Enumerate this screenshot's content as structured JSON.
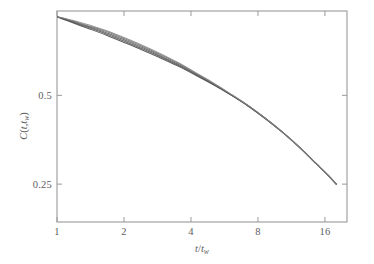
{
  "figure": {
    "background_color": "#ffffff",
    "frame_color": "#9a9a9a",
    "text_color": "#5d5d5d"
  },
  "axes": {
    "x": {
      "label_parts": {
        "numerator": "t",
        "slash": "/",
        "denominator": "t",
        "subscript": "w"
      },
      "label_plain": "t/t_w",
      "scale": "log2",
      "ticks": [
        1,
        2,
        4,
        8,
        16
      ],
      "tick_labels": [
        "1",
        "2",
        "4",
        "8",
        "16"
      ],
      "range": [
        1,
        20.1
      ]
    },
    "y": {
      "label_parts": {
        "c": "C",
        "open": "(",
        "t": "t",
        "comma": ",",
        "tw": "t",
        "sub": "w",
        "close": ")"
      },
      "label_plain": "C(t,t_w)",
      "scale": "log",
      "ticks": [
        0.5,
        0.25
      ],
      "tick_labels": [
        "0.5",
        "0.25"
      ],
      "range": [
        0.186,
        0.966
      ]
    }
  },
  "chart_data": {
    "type": "line",
    "title": "",
    "xlabel": "t/t_w",
    "ylabel": "C(t,t_w)",
    "xscale": "log",
    "yscale": "log",
    "xlim": [
      1,
      20.1
    ],
    "ylim": [
      0.186,
      0.966
    ],
    "xticks": [
      1,
      2,
      4,
      8,
      16
    ],
    "yticks": [
      0.5,
      0.25
    ],
    "grid": false,
    "legend": null,
    "series": [
      {
        "name": "t_w = 1",
        "color": "#3a3a3a",
        "x": [
          1.0,
          1.1,
          1.25,
          1.45,
          1.7,
          2.0,
          2.4,
          2.9,
          3.5,
          4.2,
          5.0,
          6.0,
          7.2,
          8.6,
          10.3,
          12.3,
          14.7,
          16.5,
          18.0
        ],
        "y": [
          0.924,
          0.898,
          0.866,
          0.832,
          0.795,
          0.756,
          0.714,
          0.671,
          0.628,
          0.585,
          0.545,
          0.503,
          0.461,
          0.418,
          0.375,
          0.333,
          0.292,
          0.268,
          0.25
        ]
      },
      {
        "name": "t_w = 2",
        "color": "#4a4a4a",
        "x": [
          1.0,
          1.1,
          1.25,
          1.45,
          1.7,
          2.0,
          2.4,
          2.9,
          3.5,
          4.2,
          5.0,
          6.0,
          7.2,
          8.6,
          10.3,
          12.3,
          14.7,
          16.5,
          18.0
        ],
        "y": [
          0.924,
          0.901,
          0.871,
          0.839,
          0.803,
          0.764,
          0.721,
          0.677,
          0.632,
          0.588,
          0.547,
          0.504,
          0.461,
          0.418,
          0.375,
          0.333,
          0.292,
          0.268,
          0.25
        ]
      },
      {
        "name": "t_w = 4",
        "color": "#565656",
        "x": [
          1.0,
          1.1,
          1.25,
          1.45,
          1.7,
          2.0,
          2.4,
          2.9,
          3.5,
          4.2,
          5.0,
          6.0,
          7.2,
          8.6,
          10.3,
          12.3,
          14.7,
          16.5,
          18.0
        ],
        "y": [
          0.924,
          0.904,
          0.876,
          0.846,
          0.811,
          0.772,
          0.728,
          0.683,
          0.637,
          0.591,
          0.549,
          0.505,
          0.462,
          0.418,
          0.375,
          0.333,
          0.292,
          0.268,
          0.25
        ]
      },
      {
        "name": "t_w = 8",
        "color": "#6a6a6a",
        "x": [
          1.0,
          1.1,
          1.25,
          1.45,
          1.7,
          2.0,
          2.4,
          2.9,
          3.5,
          4.2,
          5.0,
          6.0,
          7.2,
          8.6,
          10.3,
          12.3,
          14.7,
          16.5,
          18.0
        ],
        "y": [
          0.924,
          0.907,
          0.881,
          0.852,
          0.818,
          0.779,
          0.735,
          0.689,
          0.642,
          0.594,
          0.551,
          0.506,
          0.462,
          0.419,
          0.375,
          0.333,
          0.292,
          0.268,
          0.25
        ]
      },
      {
        "name": "t_w = 16",
        "color": "#828282",
        "x": [
          1.0,
          1.1,
          1.25,
          1.45,
          1.7,
          2.0,
          2.4,
          2.9,
          3.5,
          4.2,
          5.0,
          6.0,
          7.2,
          8.6,
          10.3,
          12.3,
          14.7,
          16.5,
          18.0
        ],
        "y": [
          0.924,
          0.91,
          0.886,
          0.858,
          0.824,
          0.785,
          0.741,
          0.694,
          0.646,
          0.597,
          0.553,
          0.507,
          0.463,
          0.419,
          0.375,
          0.333,
          0.292,
          0.268,
          0.25
        ]
      }
    ]
  }
}
